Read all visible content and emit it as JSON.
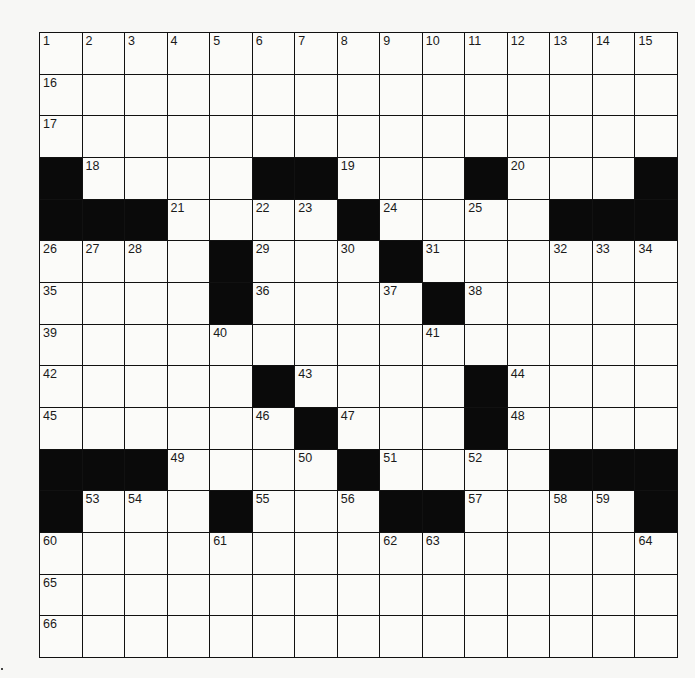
{
  "puzzle": {
    "size": {
      "rows": 15,
      "cols": 15
    },
    "colors": {
      "block": "#0a0a0a",
      "cell": "#fbfbf9",
      "line": "#111111"
    },
    "rows": [
      "...............",
      "...............",
      "...............",
      "#....##...#...#",
      "###....#....###",
      "....#...#......",
      "....#....#.....",
      "...............",
      ".....#....#....",
      "......#...#....",
      "###....#....###",
      "#...#...##....#",
      "...............",
      "...............",
      "..............."
    ],
    "numbers": [
      [
        1,
        2,
        3,
        4,
        5,
        6,
        7,
        8,
        9,
        10,
        11,
        12,
        13,
        14,
        15
      ],
      [
        16,
        0,
        0,
        0,
        0,
        0,
        0,
        0,
        0,
        0,
        0,
        0,
        0,
        0,
        0
      ],
      [
        17,
        0,
        0,
        0,
        0,
        0,
        0,
        0,
        0,
        0,
        0,
        0,
        0,
        0,
        0
      ],
      [
        0,
        18,
        0,
        0,
        0,
        0,
        0,
        19,
        0,
        0,
        0,
        20,
        0,
        0,
        0
      ],
      [
        0,
        0,
        0,
        21,
        0,
        22,
        23,
        0,
        24,
        0,
        25,
        0,
        0,
        0,
        0
      ],
      [
        26,
        27,
        28,
        0,
        0,
        29,
        0,
        30,
        0,
        31,
        0,
        0,
        32,
        33,
        34
      ],
      [
        35,
        0,
        0,
        0,
        0,
        36,
        0,
        0,
        37,
        0,
        38,
        0,
        0,
        0,
        0
      ],
      [
        39,
        0,
        0,
        0,
        40,
        0,
        0,
        0,
        0,
        41,
        0,
        0,
        0,
        0,
        0
      ],
      [
        42,
        0,
        0,
        0,
        0,
        0,
        43,
        0,
        0,
        0,
        0,
        44,
        0,
        0,
        0
      ],
      [
        45,
        0,
        0,
        0,
        0,
        46,
        0,
        47,
        0,
        0,
        0,
        48,
        0,
        0,
        0
      ],
      [
        0,
        0,
        0,
        49,
        0,
        0,
        50,
        0,
        51,
        0,
        52,
        0,
        0,
        0,
        0
      ],
      [
        0,
        53,
        54,
        0,
        0,
        55,
        0,
        56,
        0,
        0,
        57,
        0,
        58,
        59,
        0
      ],
      [
        60,
        0,
        0,
        0,
        61,
        0,
        0,
        0,
        62,
        63,
        0,
        0,
        0,
        0,
        64
      ],
      [
        65,
        0,
        0,
        0,
        0,
        0,
        0,
        0,
        0,
        0,
        0,
        0,
        0,
        0,
        0
      ],
      [
        66,
        0,
        0,
        0,
        0,
        0,
        0,
        0,
        0,
        0,
        0,
        0,
        0,
        0,
        0
      ]
    ]
  }
}
